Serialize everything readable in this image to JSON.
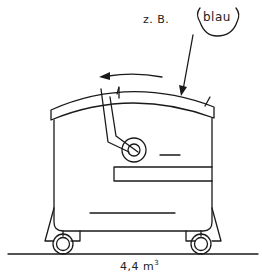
{
  "diagram": {
    "annotations": {
      "example_prefix": "z. B.",
      "lid_color": "blau",
      "volume_value": "4,4",
      "volume_unit": "m",
      "volume_exponent": "3"
    },
    "elements": [
      "curved-lid",
      "lid-opening-arrow",
      "color-callout-leader",
      "hinge-arm",
      "hinge-roller",
      "container-body",
      "front-panel-recess",
      "left-castor-wheel",
      "right-castor-wheel",
      "ground-line"
    ],
    "colors": {
      "line": "#1a1a1a",
      "background": "#ffffff"
    }
  }
}
